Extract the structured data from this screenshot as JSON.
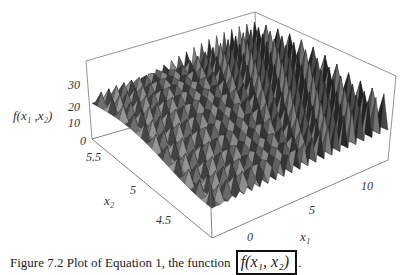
{
  "figure": {
    "caption_prefix": "Figure 7.2 Plot of Equation 1, the function",
    "caption_formula": "f(x₁, x₂)",
    "caption_suffix": "."
  },
  "axes": {
    "z_label": "f(x₁ ,x₂)",
    "x1_label": "x₁",
    "x2_label": "x₂",
    "z_ticks": [
      "0",
      "10",
      "20",
      "30"
    ],
    "x1_ticks": [
      "0",
      "5",
      "10"
    ],
    "x2_ticks": [
      "5.5",
      "5",
      "4.5"
    ]
  },
  "chart_data": {
    "type": "surface",
    "title": "",
    "xlabel": "x1",
    "ylabel": "x2",
    "zlabel": "f(x1, x2)",
    "x1_range": [
      -3,
      12.1
    ],
    "x2_range": [
      4.1,
      5.8
    ],
    "z_range": [
      0,
      38
    ],
    "x1_ticks": [
      0,
      5,
      10
    ],
    "x2_ticks": [
      4.5,
      5,
      5.5
    ],
    "z_ticks": [
      0,
      10,
      20,
      30
    ],
    "grid": false,
    "box": true,
    "shading": "grayscale"
  }
}
